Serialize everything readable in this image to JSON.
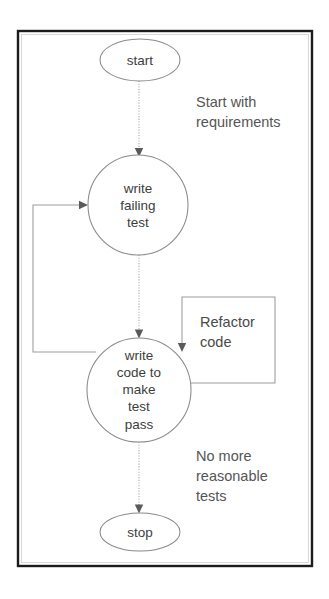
{
  "diagram": {
    "frame": {
      "x": 18,
      "y": 31,
      "width": 294,
      "height": 535
    },
    "colors": {
      "background": "#ffffff",
      "frame_border": "#1c1c1c",
      "shape_stroke": "#8a8a8a",
      "connector": "#9b9b9b",
      "text": "#4a4a4a"
    },
    "nodes": [
      {
        "id": "start",
        "shape": "ellipse",
        "label": "start",
        "cx": 140,
        "cy": 60,
        "rx": 40,
        "ry": 21
      },
      {
        "id": "write-failing-test",
        "shape": "circle",
        "label_lines": [
          "write",
          "failing",
          "test"
        ],
        "cx": 138,
        "cy": 205,
        "r": 50
      },
      {
        "id": "write-code-to-make-test-pass",
        "shape": "circle",
        "label_lines": [
          "write",
          "code to",
          "make",
          "test",
          "pass"
        ],
        "cx": 139,
        "cy": 390,
        "r": 52
      },
      {
        "id": "stop",
        "shape": "ellipse",
        "label": "stop",
        "cx": 140,
        "cy": 532,
        "rx": 40,
        "ry": 19
      }
    ],
    "boxes": [
      {
        "id": "refactor-code",
        "label_lines": [
          "Refactor",
          "code"
        ],
        "x": 182,
        "y": 297,
        "width": 93,
        "height": 86
      }
    ],
    "annotations": [
      {
        "id": "start-with-requirements",
        "lines": [
          "Start with",
          "requirements"
        ],
        "x": 196,
        "y": 105
      },
      {
        "id": "no-more-reasonable-tests",
        "lines": [
          "No more",
          "reasonable",
          "tests"
        ],
        "x": 196,
        "y": 458
      }
    ],
    "edges": [
      {
        "id": "start-to-write-failing-test",
        "from": "start",
        "to": "write-failing-test",
        "style": "dotted"
      },
      {
        "id": "write-failing-test-to-write-code",
        "from": "write-failing-test",
        "to": "write-code-to-make-test-pass",
        "style": "dotted"
      },
      {
        "id": "write-code-back-to-write-failing-test",
        "from": "write-code-to-make-test-pass",
        "to": "write-failing-test",
        "style": "solid"
      },
      {
        "id": "refactor-loop",
        "from": "write-code-to-make-test-pass",
        "to": "write-code-to-make-test-pass",
        "style": "solid"
      },
      {
        "id": "write-code-to-stop",
        "from": "write-code-to-make-test-pass",
        "to": "stop",
        "style": "dotted"
      }
    ]
  }
}
